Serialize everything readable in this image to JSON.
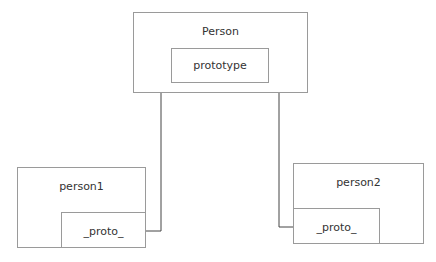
{
  "diagram": {
    "nodes": {
      "person": {
        "label": "Person",
        "inner": {
          "label": "prototype"
        }
      },
      "person1": {
        "label": "person1",
        "inner": {
          "label": "_proto_"
        }
      },
      "person2": {
        "label": "person2",
        "inner": {
          "label": "_proto_"
        }
      }
    },
    "edges": [
      {
        "from": "person1._proto_",
        "to": "person.prototype"
      },
      {
        "from": "person2._proto_",
        "to": "person.prototype"
      }
    ],
    "colors": {
      "box_border": "#9a9a9a",
      "connector": "#444444",
      "text": "#333333"
    }
  }
}
